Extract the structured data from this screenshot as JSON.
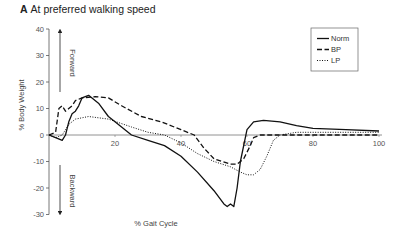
{
  "panel": {
    "letter": "A",
    "title": "At preferred walking speed"
  },
  "chart_data": {
    "type": "line",
    "title": "At preferred walking speed",
    "xlabel": "% Gait Cycle",
    "ylabel": "% Body Weight",
    "xlim": [
      0,
      100
    ],
    "ylim": [
      -30,
      40
    ],
    "xticks": [
      20,
      40,
      60,
      80,
      100
    ],
    "yticks": [
      40,
      30,
      20,
      10,
      0,
      -10,
      -20,
      -30
    ],
    "grid": false,
    "legend_position": "upper right",
    "annotations": [
      {
        "text": "Forward",
        "direction": "up"
      },
      {
        "text": "Backward",
        "direction": "down"
      }
    ],
    "series": [
      {
        "name": "Norm",
        "style": "solid",
        "x": [
          0,
          2,
          4,
          5,
          6,
          7,
          8,
          9,
          10,
          12,
          15,
          18,
          20,
          25,
          30,
          35,
          40,
          45,
          50,
          53,
          54,
          55,
          56,
          57,
          58,
          60,
          62,
          65,
          70,
          75,
          80,
          90,
          100
        ],
        "y": [
          0,
          -1,
          -2,
          0,
          5,
          8,
          9,
          11,
          14,
          15,
          12,
          7,
          5,
          0,
          -2,
          -4,
          -8,
          -14,
          -21,
          -26,
          -27,
          -26,
          -27,
          -20,
          -10,
          2,
          5,
          5.5,
          5,
          3.5,
          2.5,
          2,
          1.5
        ]
      },
      {
        "name": "BP",
        "style": "dashed",
        "x": [
          0,
          2,
          3,
          4,
          5,
          6,
          7,
          8,
          10,
          14,
          18,
          22,
          28,
          34,
          40,
          44,
          47,
          50,
          55,
          57,
          59,
          61,
          62,
          64,
          66,
          70,
          80,
          90,
          100
        ],
        "y": [
          0,
          1,
          10,
          11,
          9,
          10,
          11,
          13,
          14,
          14.5,
          14,
          11,
          7,
          5,
          2,
          0,
          -5,
          -9,
          -11,
          -11,
          -9,
          -4,
          -1,
          0,
          0,
          0,
          0,
          0,
          0
        ]
      },
      {
        "name": "LP",
        "style": "dotted",
        "x": [
          0,
          2,
          4,
          6,
          8,
          12,
          18,
          25,
          30,
          35,
          40,
          45,
          50,
          55,
          58,
          60,
          62,
          64,
          66,
          68,
          70,
          75,
          80,
          90,
          100
        ],
        "y": [
          0,
          -1,
          0,
          4,
          6,
          7,
          6,
          3,
          1,
          0,
          -3,
          -7,
          -10,
          -12,
          -14,
          -15,
          -15,
          -13,
          -8,
          -2,
          0,
          1,
          1,
          1,
          1
        ]
      }
    ]
  },
  "legend": [
    "Norm",
    "BP",
    "LP"
  ]
}
